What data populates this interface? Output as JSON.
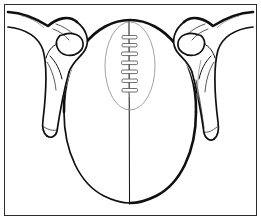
{
  "figure": {
    "border_color": "#2b2b2b",
    "ink_color": "#101010",
    "faint_ink_color": "#8a8a8a",
    "background_color": "#ffffff",
    "style": "black-and-white line drawing",
    "canvas": {
      "width": 261,
      "height": 220
    }
  },
  "ball": {
    "name": "football",
    "view": "top-down end view",
    "seam": "vertical center seam",
    "lace_panel": "faint oval panel around laces",
    "lace_count": 7,
    "outline_color": "#101010"
  },
  "hands": [
    {
      "name": "left-hand",
      "side": "left",
      "thumb": "upper thumb over ball edge",
      "fingers": "fingers extending downward along ball side"
    },
    {
      "name": "right-hand",
      "side": "right",
      "thumb": "upper thumb over ball edge",
      "fingers": "fingers extending downward along ball side"
    }
  ],
  "labels": {
    "alt_text": "Illustration of two hands holding a football with laces facing up"
  }
}
